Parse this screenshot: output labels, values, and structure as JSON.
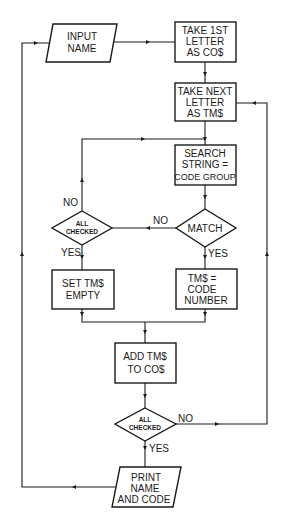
{
  "diagram": {
    "type": "flowchart",
    "nodes": {
      "input_name": {
        "kind": "io",
        "lines": [
          "INPUT",
          "NAME"
        ]
      },
      "take_first": {
        "kind": "process",
        "lines": [
          "TAKE 1ST",
          "LETTER",
          "AS CO$"
        ]
      },
      "take_next": {
        "kind": "process",
        "lines": [
          "TAKE NEXT",
          "LETTER",
          "AS TM$"
        ]
      },
      "search": {
        "kind": "process",
        "lines": [
          "SEARCH",
          "STRING =",
          "CODE GROUP"
        ]
      },
      "match": {
        "kind": "decision",
        "lines": [
          "MATCH"
        ]
      },
      "all_checked_1": {
        "kind": "decision",
        "lines": [
          "ALL",
          "CHECKED"
        ]
      },
      "set_empty": {
        "kind": "process",
        "lines": [
          "SET TM$",
          "EMPTY"
        ]
      },
      "code_number": {
        "kind": "process",
        "lines": [
          "TM$ =",
          "CODE",
          "NUMBER"
        ]
      },
      "add": {
        "kind": "process",
        "lines": [
          "ADD TM$",
          "TO CO$"
        ]
      },
      "all_checked_2": {
        "kind": "decision",
        "lines": [
          "ALL",
          "CHECKED"
        ]
      },
      "print": {
        "kind": "io",
        "lines": [
          "PRINT",
          "NAME",
          "AND CODE"
        ]
      }
    },
    "edge_labels": {
      "match_no": "NO",
      "match_yes": "YES",
      "all1_no": "NO",
      "all1_yes": "YES",
      "all2_no": "NO",
      "all2_yes": "YES"
    },
    "edges": [
      {
        "from": "input_name",
        "to": "take_first"
      },
      {
        "from": "take_first",
        "to": "take_next"
      },
      {
        "from": "take_next",
        "to": "search"
      },
      {
        "from": "search",
        "to": "match"
      },
      {
        "from": "match",
        "to": "all_checked_1",
        "label": "NO"
      },
      {
        "from": "match",
        "to": "code_number",
        "label": "YES"
      },
      {
        "from": "all_checked_1",
        "to": "search",
        "label": "NO"
      },
      {
        "from": "all_checked_1",
        "to": "set_empty",
        "label": "YES"
      },
      {
        "from": "set_empty",
        "to": "add"
      },
      {
        "from": "code_number",
        "to": "add"
      },
      {
        "from": "add",
        "to": "all_checked_2"
      },
      {
        "from": "all_checked_2",
        "to": "take_next",
        "label": "NO"
      },
      {
        "from": "all_checked_2",
        "to": "print",
        "label": "YES"
      },
      {
        "from": "print",
        "to": "input_name"
      }
    ]
  }
}
